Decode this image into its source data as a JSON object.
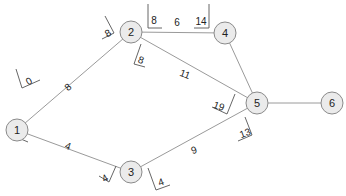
{
  "diagram": {
    "type": "network-graph",
    "colors": {
      "node_fill": "#ebebeb",
      "node_stroke": "#8a8a8a",
      "edge": "#9a9a9a",
      "text": "#222222"
    },
    "nodes": [
      {
        "id": "1",
        "label": "1",
        "x": 17,
        "y": 130
      },
      {
        "id": "2",
        "label": "2",
        "x": 131,
        "y": 32
      },
      {
        "id": "3",
        "label": "3",
        "x": 131,
        "y": 172
      },
      {
        "id": "4",
        "label": "4",
        "x": 225,
        "y": 33
      },
      {
        "id": "5",
        "label": "5",
        "x": 257,
        "y": 103
      },
      {
        "id": "6",
        "label": "6",
        "x": 332,
        "y": 103
      }
    ],
    "edges": [
      {
        "from": "1",
        "to": "2",
        "weight": "8"
      },
      {
        "from": "1",
        "to": "3",
        "weight": "4"
      },
      {
        "from": "2",
        "to": "4",
        "weight": "6"
      },
      {
        "from": "2",
        "to": "5",
        "weight": "11"
      },
      {
        "from": "3",
        "to": "5",
        "weight": "9"
      },
      {
        "from": "4",
        "to": "5",
        "weight": ""
      },
      {
        "from": "5",
        "to": "6",
        "weight": ""
      }
    ],
    "time_labels": [
      {
        "near": "1-2 start",
        "value": "0"
      },
      {
        "near": "1-2 end",
        "value": "8"
      },
      {
        "near": "1-3 start",
        "value": "0"
      },
      {
        "near": "1-3 end",
        "value": "4"
      },
      {
        "near": "2-4 start",
        "value": "8"
      },
      {
        "near": "2-4 end",
        "value": "14"
      },
      {
        "near": "2-5 start",
        "value": "8"
      },
      {
        "near": "2-5 end",
        "value": "19"
      },
      {
        "near": "3-5 start",
        "value": "4"
      },
      {
        "near": "3-5 end",
        "value": "13"
      }
    ]
  }
}
